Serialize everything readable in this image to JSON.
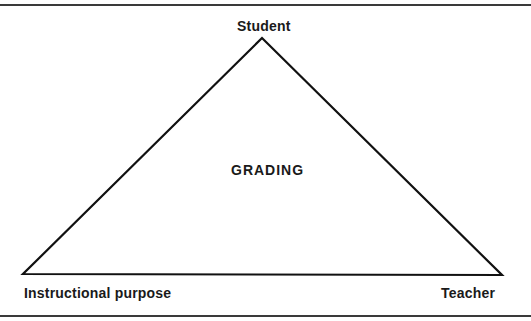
{
  "diagram": {
    "type": "triangle",
    "center_label": "GRADING",
    "vertices": {
      "top": "Student",
      "bottom_left": "Instructional purpose",
      "bottom_right": "Teacher"
    },
    "colors": {
      "stroke": "#111111",
      "rule": "#3a3a3a",
      "text": "#1a1a1a",
      "background": "#ffffff"
    }
  }
}
